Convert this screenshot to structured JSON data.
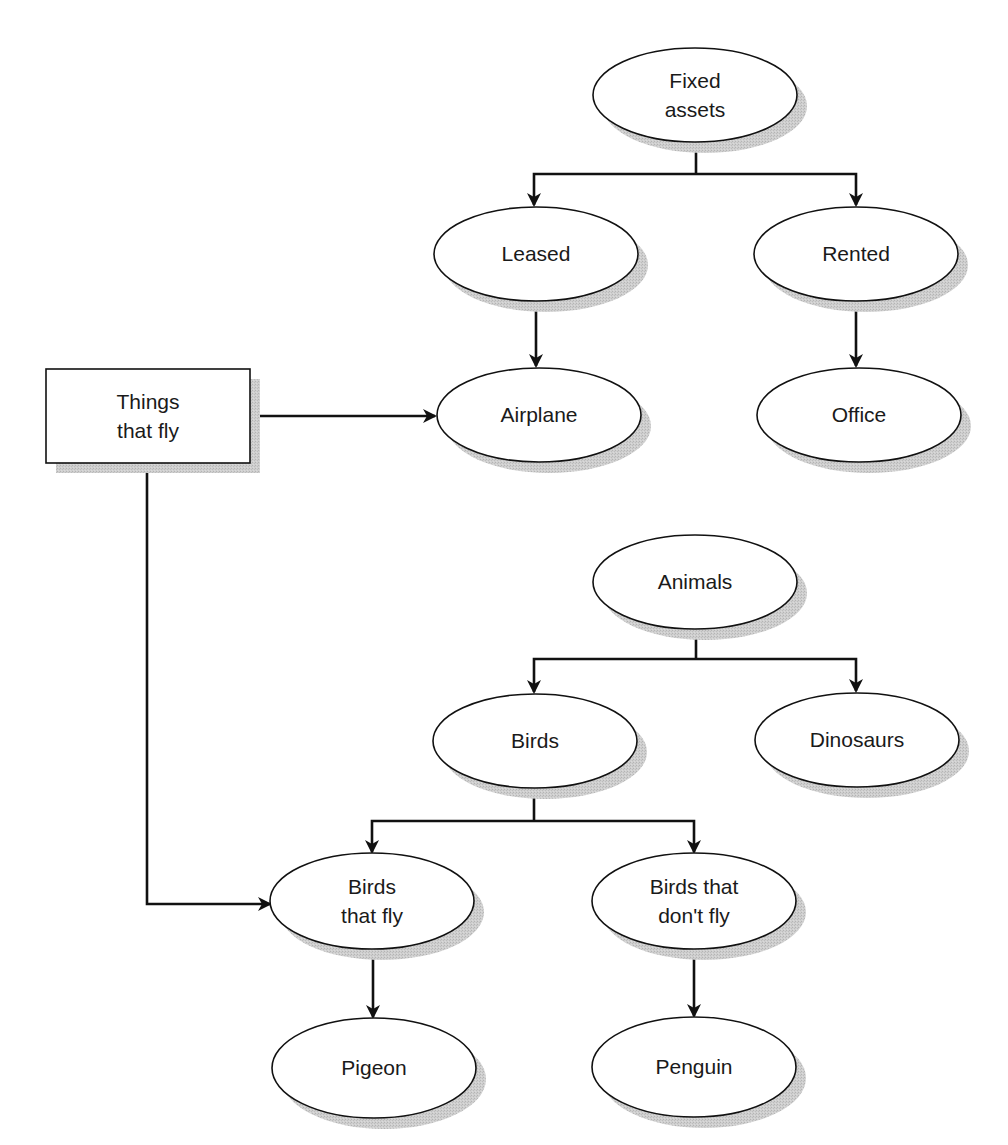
{
  "diagram": {
    "type": "hierarchy-diagram",
    "colors": {
      "stroke": "#111111",
      "fill": "#ffffff",
      "shadow": "#c8c8c8",
      "text": "#1a1a1a"
    },
    "nodes": {
      "fixed_assets": {
        "label_lines": [
          "Fixed",
          "assets"
        ],
        "shape": "ellipse",
        "cx": 695,
        "cy": 95
      },
      "leased": {
        "label_lines": [
          "Leased"
        ],
        "shape": "ellipse",
        "cx": 536,
        "cy": 254
      },
      "rented": {
        "label_lines": [
          "Rented"
        ],
        "shape": "ellipse",
        "cx": 856,
        "cy": 254
      },
      "airplane": {
        "label_lines": [
          "Airplane"
        ],
        "shape": "ellipse",
        "cx": 539,
        "cy": 415
      },
      "office": {
        "label_lines": [
          "Office"
        ],
        "shape": "ellipse",
        "cx": 859,
        "cy": 415
      },
      "things_that_fly": {
        "label_lines": [
          "Things",
          "that fly"
        ],
        "shape": "rectangle",
        "x": 46,
        "y": 369,
        "w": 204,
        "h": 94
      },
      "animals": {
        "label_lines": [
          "Animals"
        ],
        "shape": "ellipse",
        "cx": 695,
        "cy": 582
      },
      "birds": {
        "label_lines": [
          "Birds"
        ],
        "shape": "ellipse",
        "cx": 535,
        "cy": 741
      },
      "dinosaurs": {
        "label_lines": [
          "Dinosaurs"
        ],
        "shape": "ellipse",
        "cx": 857,
        "cy": 740
      },
      "birds_that_fly": {
        "label_lines": [
          "Birds",
          "that fly"
        ],
        "shape": "ellipse",
        "cx": 372,
        "cy": 901
      },
      "birds_that_dont_fly": {
        "label_lines": [
          "Birds that",
          "don't fly"
        ],
        "shape": "ellipse",
        "cx": 694,
        "cy": 901
      },
      "pigeon": {
        "label_lines": [
          "Pigeon"
        ],
        "shape": "ellipse",
        "cx": 374,
        "cy": 1068
      },
      "penguin": {
        "label_lines": [
          "Penguin"
        ],
        "shape": "ellipse",
        "cx": 694,
        "cy": 1067
      }
    },
    "edges": [
      {
        "from": "fixed_assets",
        "to": "leased"
      },
      {
        "from": "fixed_assets",
        "to": "rented"
      },
      {
        "from": "leased",
        "to": "airplane"
      },
      {
        "from": "rented",
        "to": "office"
      },
      {
        "from": "things_that_fly",
        "to": "airplane"
      },
      {
        "from": "things_that_fly",
        "to": "birds_that_fly"
      },
      {
        "from": "animals",
        "to": "birds"
      },
      {
        "from": "animals",
        "to": "dinosaurs"
      },
      {
        "from": "birds",
        "to": "birds_that_fly"
      },
      {
        "from": "birds",
        "to": "birds_that_dont_fly"
      },
      {
        "from": "birds_that_fly",
        "to": "pigeon"
      },
      {
        "from": "birds_that_dont_fly",
        "to": "penguin"
      }
    ]
  }
}
